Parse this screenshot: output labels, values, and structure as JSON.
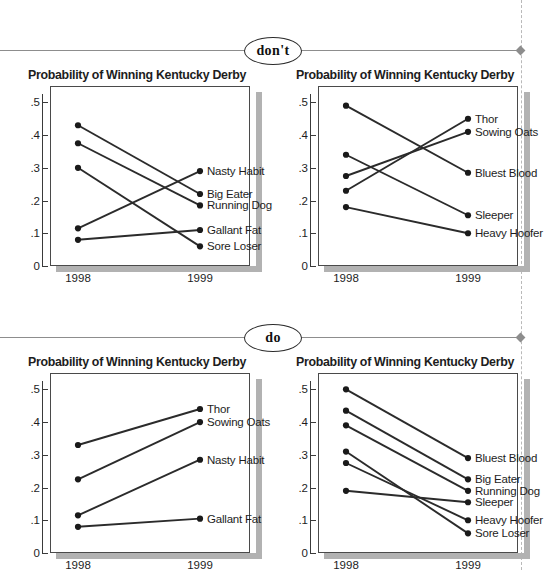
{
  "page": {
    "dont_badge": "don't",
    "do_badge": "do"
  },
  "chart_data": [
    {
      "id": "dont-left",
      "type": "line",
      "title": "Probability of Winning Kentucky Derby",
      "xlabel": "",
      "ylabel": "",
      "categories": [
        "1998",
        "1999"
      ],
      "yticks": [
        0,
        0.1,
        0.2,
        0.3,
        0.4,
        0.5
      ],
      "ytick_labels": [
        "0",
        ".1",
        ".2",
        ".3",
        ".4",
        ".5"
      ],
      "ylim": [
        0,
        0.55
      ],
      "grid": false,
      "legend": "right-inline-labels",
      "series": [
        {
          "name": "Big Eater",
          "values": [
            0.43,
            0.22
          ]
        },
        {
          "name": "Running Dog",
          "values": [
            0.375,
            0.185
          ]
        },
        {
          "name": "Sore Loser",
          "values": [
            0.3,
            0.06
          ]
        },
        {
          "name": "Nasty Habit",
          "values": [
            0.115,
            0.29
          ]
        },
        {
          "name": "Gallant Fat",
          "values": [
            0.08,
            0.11
          ]
        }
      ]
    },
    {
      "id": "dont-right",
      "type": "line",
      "title": "Probability of Winning Kentucky Derby",
      "xlabel": "",
      "ylabel": "",
      "categories": [
        "1998",
        "1999"
      ],
      "yticks": [
        0,
        0.1,
        0.2,
        0.3,
        0.4,
        0.5
      ],
      "ytick_labels": [
        "0",
        ".1",
        ".2",
        ".3",
        ".4",
        ".5"
      ],
      "ylim": [
        0,
        0.55
      ],
      "grid": false,
      "legend": "right-inline-labels",
      "series": [
        {
          "name": "Bluest Blood",
          "values": [
            0.49,
            0.285
          ]
        },
        {
          "name": "Sleeper",
          "values": [
            0.34,
            0.155
          ]
        },
        {
          "name": "Sowing Oats",
          "values": [
            0.275,
            0.41
          ]
        },
        {
          "name": "Thor",
          "values": [
            0.23,
            0.45
          ]
        },
        {
          "name": "Heavy Hoofer",
          "values": [
            0.18,
            0.1
          ]
        }
      ]
    },
    {
      "id": "do-left",
      "type": "line",
      "title": "Probability of Winning Kentucky Derby",
      "xlabel": "",
      "ylabel": "",
      "categories": [
        "1998",
        "1999"
      ],
      "yticks": [
        0,
        0.1,
        0.2,
        0.3,
        0.4,
        0.5
      ],
      "ytick_labels": [
        "0",
        ".1",
        ".2",
        ".3",
        ".4",
        ".5"
      ],
      "ylim": [
        0,
        0.55
      ],
      "grid": false,
      "legend": "right-inline-labels",
      "series": [
        {
          "name": "Thor",
          "values": [
            0.33,
            0.44
          ]
        },
        {
          "name": "Sowing Oats",
          "values": [
            0.225,
            0.4
          ]
        },
        {
          "name": "Nasty Habit",
          "values": [
            0.115,
            0.285
          ]
        },
        {
          "name": "Gallant Fat",
          "values": [
            0.08,
            0.105
          ]
        }
      ]
    },
    {
      "id": "do-right",
      "type": "line",
      "title": "Probability of Winning Kentucky Derby",
      "xlabel": "",
      "ylabel": "",
      "categories": [
        "1998",
        "1999"
      ],
      "yticks": [
        0,
        0.1,
        0.2,
        0.3,
        0.4,
        0.5
      ],
      "ytick_labels": [
        "0",
        ".1",
        ".2",
        ".3",
        ".4",
        ".5"
      ],
      "ylim": [
        0,
        0.55
      ],
      "grid": false,
      "legend": "right-inline-labels",
      "series": [
        {
          "name": "Bluest Blood",
          "values": [
            0.5,
            0.29
          ]
        },
        {
          "name": "Big Eater",
          "values": [
            0.435,
            0.225
          ]
        },
        {
          "name": "Running Dog",
          "values": [
            0.39,
            0.19
          ]
        },
        {
          "name": "Sore Loser",
          "values": [
            0.31,
            0.06
          ]
        },
        {
          "name": "Heavy Hoofer",
          "values": [
            0.275,
            0.1
          ]
        },
        {
          "name": "Sleeper",
          "values": [
            0.19,
            0.155
          ]
        }
      ]
    }
  ]
}
